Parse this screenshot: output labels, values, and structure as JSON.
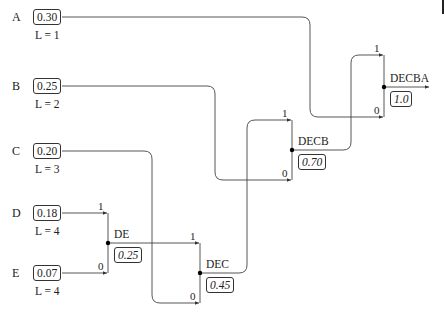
{
  "diagram": {
    "type": "huffman-coding-tree",
    "symbols": [
      {
        "name": "A",
        "prob": "0.30",
        "length": "L = 1"
      },
      {
        "name": "B",
        "prob": "0.25",
        "length": "L = 2"
      },
      {
        "name": "C",
        "prob": "0.20",
        "length": "L = 3"
      },
      {
        "name": "D",
        "prob": "0.18",
        "length": "L = 4"
      },
      {
        "name": "E",
        "prob": "0.07",
        "length": "L = 4"
      }
    ],
    "merges": [
      {
        "name": "DE",
        "prob": "0.25",
        "one": "1",
        "zero": "0",
        "inputs": [
          "D (1)",
          "E (0)"
        ]
      },
      {
        "name": "DEC",
        "prob": "0.45",
        "one": "1",
        "zero": "0",
        "inputs": [
          "DE (1)",
          "C (0)"
        ]
      },
      {
        "name": "DECB",
        "prob": "0.70",
        "one": "1",
        "zero": "0",
        "inputs": [
          "DEC (1)",
          "B (0)"
        ]
      },
      {
        "name": "DECBA",
        "prob": "1.0",
        "one": "1",
        "zero": "0",
        "inputs": [
          "DECB (1)",
          "A (0)"
        ]
      }
    ],
    "colors": {
      "line": "#333333",
      "node": "#000000",
      "background": "#ffffff"
    }
  }
}
